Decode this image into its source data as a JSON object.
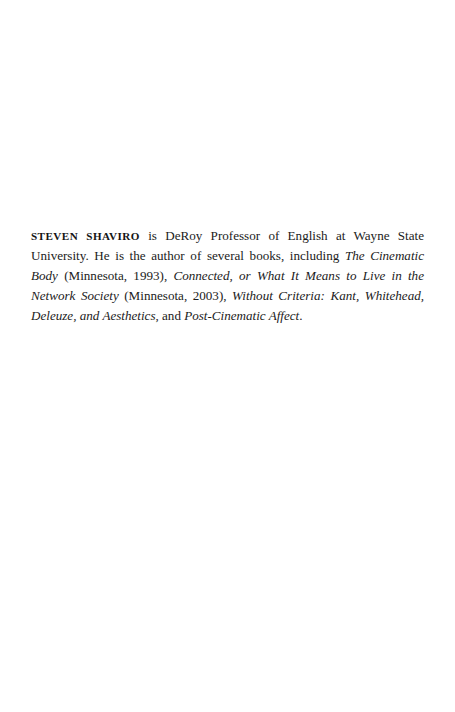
{
  "page": {
    "kind": "scanned-book-page",
    "background_color": "#ffffff",
    "text_color": "#1b1b1b",
    "width": 455,
    "height": 712
  },
  "bio": {
    "author_name": "STEVEN SHAVIRO",
    "segment_after_name": " is DeRoy Professor of English at Wayne State University. He is the author of several books, including ",
    "title_1": "The Cinematic Body",
    "segment_2": " (Minnesota, 1993), ",
    "title_2": "Connected, or What It Means to Live in the Network Society",
    "segment_3": " (Minnesota, 2003), ",
    "title_3": "Without Criteria: Kant, Whitehead, Deleuze, and Aesthetics",
    "segment_4": ", and ",
    "title_4": "Post-Cinematic Affect",
    "segment_5": ".",
    "full_text": "STEVEN SHAVIRO is DeRoy Professor of English at Wayne State University. He is the author of several books, including The Cinematic Body (Minnesota, 1993), Connected, or What It Means to Live in the Network Society (Minnesota, 2003), Without Criteria: Kant, Whitehead, Deleuze, and Aesthetics, and Post-Cinematic Affect."
  }
}
